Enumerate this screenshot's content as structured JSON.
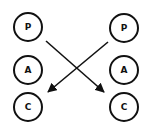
{
  "diagram": {
    "left_column": [
      {
        "id": "L-P",
        "label": "P",
        "cx": 28,
        "cy": 27
      },
      {
        "id": "L-A",
        "label": "A",
        "cx": 28,
        "cy": 70
      },
      {
        "id": "L-C",
        "label": "C",
        "cx": 28,
        "cy": 107
      }
    ],
    "right_column": [
      {
        "id": "R-P",
        "label": "P",
        "cx": 124,
        "cy": 28
      },
      {
        "id": "R-A",
        "label": "A",
        "cx": 124,
        "cy": 70
      },
      {
        "id": "R-C",
        "label": "C",
        "cx": 124,
        "cy": 107
      }
    ],
    "edges": [
      {
        "from": "L-P",
        "to": "R-C"
      },
      {
        "from": "R-P",
        "to": "L-C"
      }
    ],
    "colors": {
      "stroke": "#111111",
      "background": "#ffffff"
    }
  }
}
